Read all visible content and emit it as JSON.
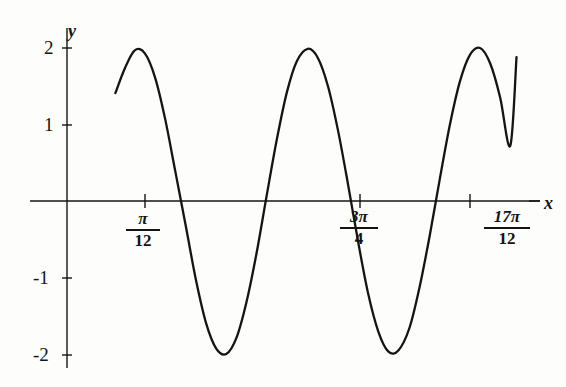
{
  "figure": {
    "background_color": "#fdfdfc",
    "ink_color": "#141414",
    "axis_label_x": "x",
    "axis_label_y": "y"
  },
  "y_ticks": [
    {
      "label": "2",
      "value": 2
    },
    {
      "label": "1",
      "value": 1
    },
    {
      "label": "-1",
      "value": -1
    },
    {
      "label": "-2",
      "value": -2
    }
  ],
  "x_ticks": [
    {
      "numerator": "π",
      "denominator": "12",
      "value": 0.2618
    },
    {
      "numerator": "3π",
      "denominator": "4",
      "value": 2.3562
    },
    {
      "numerator": "17π",
      "denominator": "12",
      "value": 4.4506
    }
  ],
  "chart_data": {
    "type": "line",
    "title": "",
    "subtitle": "",
    "xlabel": "x",
    "ylabel": "y",
    "grid": false,
    "legend": "none",
    "amplitude": 2,
    "period_label": "π",
    "function_expression": "y = 2 sin(2x + π/3)",
    "xlim": [
      -0.12,
      5.05
    ],
    "ylim": [
      -2.35,
      2.35
    ],
    "y_tick_values": [
      2,
      1,
      -1,
      -2
    ],
    "y_tick_labels": [
      "2",
      "1",
      "-1",
      "-2"
    ],
    "x_tick_values": [
      0.2618,
      2.3562,
      4.4506
    ],
    "x_tick_labels": [
      "π/12",
      "3π/4",
      "17π/12"
    ],
    "zero_crossings": [
      0.2618,
      1.309,
      2.3562,
      3.4034,
      4.4506
    ],
    "maxima": [
      {
        "x": 0.0,
        "y": 2
      },
      {
        "x": 2.0944,
        "y": 2
      },
      {
        "x": 4.1888,
        "y": 2
      }
    ],
    "minima": [
      {
        "x": 1.0472,
        "y": -2
      },
      {
        "x": 3.1416,
        "y": -2
      }
    ],
    "start_point": {
      "x": -0.12,
      "y": 1.41
    },
    "end_point": {
      "x": 5.05,
      "y": 1.88
    },
    "series": [
      {
        "name": "y = 2 sin(2x + π/3)",
        "x": [
          -0.12,
          0.0,
          0.13,
          0.26,
          0.39,
          0.52,
          0.65,
          0.79,
          0.92,
          1.05,
          1.18,
          1.31,
          1.44,
          1.57,
          1.7,
          1.83,
          1.96,
          2.09,
          2.22,
          2.36,
          2.49,
          2.62,
          2.75,
          2.88,
          3.01,
          3.14,
          3.27,
          3.4,
          3.53,
          3.67,
          3.8,
          3.93,
          4.06,
          4.19,
          4.32,
          4.45,
          4.58,
          4.71,
          4.84,
          4.97,
          5.05
        ],
        "y": [
          1.41,
          1.73,
          1.97,
          1.93,
          1.62,
          1.08,
          0.4,
          -0.34,
          -1.04,
          -1.6,
          -1.93,
          -2.0,
          -1.79,
          -1.32,
          -0.68,
          0.07,
          0.8,
          1.42,
          1.83,
          1.99,
          1.87,
          1.5,
          0.92,
          0.21,
          -0.54,
          -1.22,
          -1.71,
          -1.97,
          -1.95,
          -1.66,
          -1.13,
          -0.46,
          0.28,
          0.99,
          1.56,
          1.91,
          2.0,
          1.8,
          1.35,
          0.72,
          1.88
        ]
      }
    ]
  }
}
